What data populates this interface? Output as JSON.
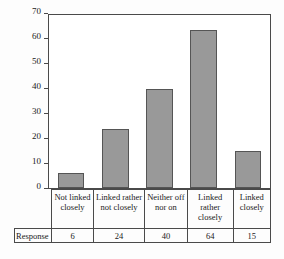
{
  "chart_data": {
    "type": "bar",
    "title": "",
    "xlabel": "",
    "ylabel": "",
    "categories": [
      "Not linked closely",
      "Linked rather not closely",
      "Neither off nor on",
      "Linked rather closely",
      "Linked closely"
    ],
    "values": [
      6,
      24,
      40,
      64,
      15
    ],
    "ylim": [
      0,
      70
    ],
    "yticks": [
      0,
      10,
      20,
      30,
      40,
      50,
      60,
      70
    ],
    "ytick_labels": [
      "0",
      "10",
      "20",
      "30",
      "40",
      "50",
      "60",
      "70"
    ],
    "grid": false,
    "legend": "none",
    "bar_color": "#999999",
    "bar_edge_color": "#555555",
    "axis_color": "#4a4a4a"
  },
  "table": {
    "row_header": "Response",
    "category_labels": [
      "Not linked closely",
      "Linked rather not closely",
      "Neither off nor on",
      "Linked rather closely",
      "Linked closely"
    ],
    "values": [
      "6",
      "24",
      "40",
      "64",
      "15"
    ]
  }
}
